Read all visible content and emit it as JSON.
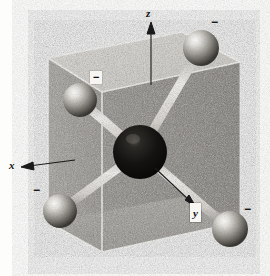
{
  "figure": {
    "style": "grayscale halftone line drawing",
    "background_color": "#fdfdfc"
  },
  "axes": [
    {
      "id": "z",
      "label": "z",
      "direction": "up",
      "arrow": "↑"
    },
    {
      "id": "x",
      "label": "x",
      "direction": "left",
      "arrow": "←"
    },
    {
      "id": "y",
      "label": "y",
      "direction": "down-right",
      "arrow": "↘"
    }
  ],
  "charges": [
    {
      "id": "charge-top-right",
      "label": "−",
      "boxed": false
    },
    {
      "id": "charge-upper-left",
      "label": "−",
      "boxed": true
    },
    {
      "id": "charge-lower-left",
      "label": "−",
      "boxed": false
    },
    {
      "id": "charge-bottom-right",
      "label": "−",
      "boxed": false
    }
  ],
  "atoms": {
    "center": {
      "id": "central-atom",
      "kind": "central",
      "color": "#151515",
      "radius": 27,
      "cx": 140,
      "cy": 152
    },
    "outer": [
      {
        "id": "atom-top-right",
        "cx": 201,
        "cy": 48,
        "radius": 18
      },
      {
        "id": "atom-upper-left",
        "cx": 80,
        "cy": 100,
        "radius": 17
      },
      {
        "id": "atom-lower-left",
        "cx": 60,
        "cy": 211,
        "radius": 17
      },
      {
        "id": "atom-bottom-right",
        "cx": 230,
        "cy": 229,
        "radius": 18
      }
    ]
  },
  "bonds": [
    {
      "id": "bond-center-top-right",
      "from": "central-atom",
      "to": "atom-top-right"
    },
    {
      "id": "bond-center-upper-left",
      "from": "central-atom",
      "to": "atom-upper-left"
    },
    {
      "id": "bond-center-lower-left",
      "from": "central-atom",
      "to": "atom-lower-left"
    },
    {
      "id": "bond-center-bottom-right",
      "from": "central-atom",
      "to": "atom-bottom-right"
    }
  ],
  "cube": {
    "id": "reference-cube",
    "faces": [
      "top",
      "front-left",
      "front-right",
      "bottom"
    ],
    "top_face_color": "#dedbd4",
    "left_face_color": "#9d9a94",
    "right_face_color": "#8e8b85",
    "bottom_face_color": "#a6a39d",
    "edge_color": "#f4f3f0"
  },
  "colors": {
    "ink": "#111111",
    "sphere_light": "#f2f1ee",
    "sphere_mid": "#8d8a84",
    "sphere_dark": "#3a3834",
    "bond": "#e9e7e2"
  }
}
